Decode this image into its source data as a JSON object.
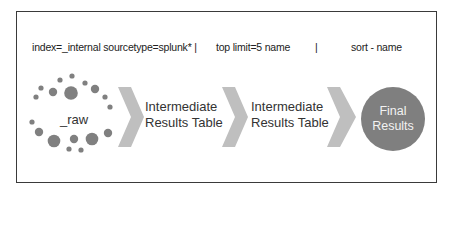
{
  "command": {
    "segment1": "index=_internal sourcetype=splunk* |",
    "segment2": "top limit=5 name",
    "separator": "|",
    "segment3": "sort - name"
  },
  "stages": {
    "raw_label": "_raw",
    "intermediate1_line1": "Intermediate",
    "intermediate1_line2": "Results Table",
    "intermediate2_line1": "Intermediate",
    "intermediate2_line2": "Results Table",
    "final_line1": "Final",
    "final_line2": "Results"
  },
  "colors": {
    "dot": "#808080",
    "chevron": "#bfbfbf",
    "final_circle": "#7f7f7f"
  }
}
